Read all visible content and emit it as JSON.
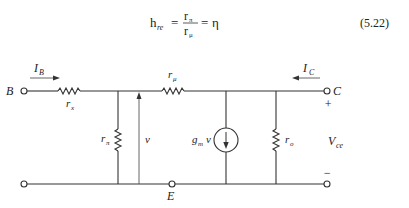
{
  "equation": {
    "lhs_main": "h",
    "lhs_sub": "re",
    "frac_num_main": "r",
    "frac_num_sub": "π",
    "frac_den_main": "r",
    "frac_den_sub": "μ",
    "rhs": "η",
    "equals": "=",
    "number": "(5.22)"
  },
  "circuit": {
    "terminals": {
      "base": "B",
      "collector": "C",
      "emitter": "E"
    },
    "currents": {
      "base_current_main": "I",
      "base_current_sub": "B",
      "collector_current_main": "I",
      "collector_current_sub": "C"
    },
    "components": {
      "rx_main": "r",
      "rx_sub": "x",
      "rpi_main": "r",
      "rpi_sub": "π",
      "rmu_main": "r",
      "rmu_sub": "μ",
      "ro_main": "r",
      "ro_sub": "o",
      "source_main": "g",
      "source_sub": "m",
      "source_var": "v"
    },
    "voltage_v": "v",
    "vce_main": "V",
    "vce_sub": "ce",
    "plus": "+",
    "minus": "−"
  }
}
